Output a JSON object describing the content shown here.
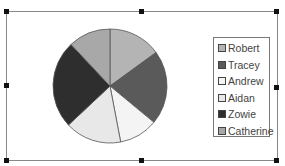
{
  "chart_data": {
    "type": "pie",
    "title": "",
    "categories": [
      "Robert",
      "Tracey",
      "Andrew",
      "Aidan",
      "Zowie",
      "Catherine"
    ],
    "values": [
      15,
      21,
      11,
      16,
      25,
      12
    ],
    "colors": [
      "#b4b4b4",
      "#5a5a5a",
      "#f4f4f4",
      "#e8e8e8",
      "#2e2e2e",
      "#a8a8a8"
    ],
    "legend_position": "right",
    "start_angle": 0,
    "direction": "clockwise"
  },
  "legend": {
    "items": [
      {
        "label": "Robert"
      },
      {
        "label": "Tracey"
      },
      {
        "label": "Andrew"
      },
      {
        "label": "Aidan"
      },
      {
        "label": "Zowie"
      },
      {
        "label": "Catherine"
      }
    ]
  }
}
